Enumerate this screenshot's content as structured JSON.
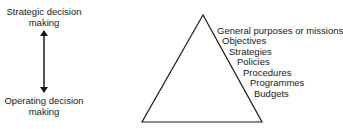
{
  "left_axis": {
    "top_label_line1": "Strategic decision",
    "top_label_line2": "making",
    "bottom_label_line1": "Operating decision",
    "bottom_label_line2": "making"
  },
  "pyramid": {
    "levels": [
      "General purposes or missions",
      "Objectives",
      "Strategies",
      "Policies",
      "Procedures",
      "Programmes",
      "Budgets"
    ]
  }
}
